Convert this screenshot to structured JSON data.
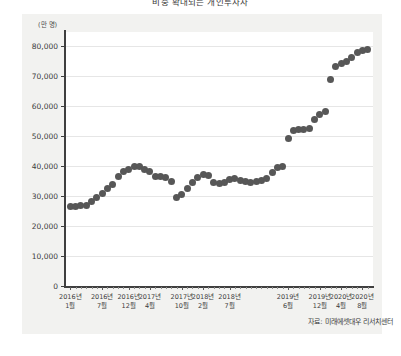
{
  "chart_title": "비중 확대되는 개인투자자",
  "unit_label": "(만 명)",
  "source_note": "자료: 미래에셋대우 리서치센터",
  "chart_data": {
    "type": "scatter",
    "title": "비중 확대되는 개인투자자",
    "xlabel": "",
    "ylabel": "",
    "unit": "만 명",
    "ylim": [
      0,
      80000
    ],
    "ytick_values": [
      0,
      10000,
      20000,
      30000,
      40000,
      50000,
      60000,
      70000,
      80000
    ],
    "ytick_labels": [
      "0",
      "10,000",
      "20,000",
      "30,000",
      "40,000",
      "50,000",
      "60,000",
      "70,000",
      "80,000"
    ],
    "grid": true,
    "legend": "none",
    "xtick_labels": [
      {
        "year": "2016년",
        "month": "1월"
      },
      {
        "year": "2016년",
        "month": "7월"
      },
      {
        "year": "2016년",
        "month": "12월"
      },
      {
        "year": "2017년",
        "month": "4월"
      },
      {
        "year": "2017년",
        "month": "10월"
      },
      {
        "year": "2018년",
        "month": "2월"
      },
      {
        "year": "2018년",
        "month": "7월"
      },
      {
        "year": "2019년",
        "month": "6월"
      },
      {
        "year": "2019년",
        "month": "12월"
      },
      {
        "year": "2020년",
        "month": "4월"
      },
      {
        "year": "2020년",
        "month": "8월"
      }
    ],
    "xtick_positions": [
      0,
      6,
      11,
      15,
      21,
      25,
      30,
      41,
      47,
      51,
      55
    ],
    "series": [
      {
        "name": "개인투자자 수",
        "color": "#575757",
        "values": [
          26500,
          26600,
          26800,
          27000,
          28200,
          29500,
          31000,
          32500,
          34000,
          36500,
          38300,
          39000,
          40000,
          39800,
          38800,
          38200,
          36500,
          36400,
          36300,
          35000,
          29500,
          30500,
          32500,
          34500,
          36200,
          37200,
          36800,
          34500,
          34200,
          34500,
          35500,
          35800,
          35300,
          34800,
          34600,
          35000,
          35200,
          36000,
          38000,
          39600,
          39700,
          49200,
          51800,
          52200,
          52300,
          52400,
          55500,
          57200,
          58300,
          69000,
          73200,
          74200,
          74800,
          76200,
          78000,
          78500,
          79000
        ]
      }
    ]
  }
}
